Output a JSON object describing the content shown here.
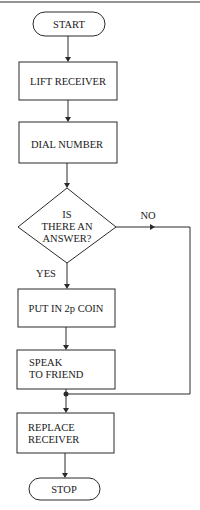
{
  "diagram": {
    "type": "flowchart",
    "nodes": [
      {
        "id": "start",
        "shape": "terminator",
        "lines": [
          "START"
        ]
      },
      {
        "id": "lift",
        "shape": "process",
        "lines": [
          "LIFT RECEIVER"
        ]
      },
      {
        "id": "dial",
        "shape": "process",
        "lines": [
          "DIAL NUMBER"
        ]
      },
      {
        "id": "answer",
        "shape": "decision",
        "lines": [
          "IS",
          "THERE AN",
          "ANSWER?"
        ]
      },
      {
        "id": "coin",
        "shape": "process",
        "lines": [
          "PUT IN 2p COIN"
        ]
      },
      {
        "id": "speak",
        "shape": "process",
        "lines": [
          "SPEAK",
          "TO FRIEND"
        ]
      },
      {
        "id": "replace",
        "shape": "process",
        "lines": [
          "REPLACE",
          "RECEIVER"
        ]
      },
      {
        "id": "stop",
        "shape": "terminator",
        "lines": [
          "STOP"
        ]
      }
    ],
    "edges": [
      {
        "from": "start",
        "to": "lift",
        "label": ""
      },
      {
        "from": "lift",
        "to": "dial",
        "label": ""
      },
      {
        "from": "dial",
        "to": "answer",
        "label": ""
      },
      {
        "from": "answer",
        "to": "coin",
        "label": "YES"
      },
      {
        "from": "answer",
        "to": "replace",
        "label": "NO"
      },
      {
        "from": "coin",
        "to": "speak",
        "label": ""
      },
      {
        "from": "speak",
        "to": "replace",
        "label": ""
      },
      {
        "from": "replace",
        "to": "stop",
        "label": ""
      }
    ],
    "colors": {
      "line": "#2a2a2a",
      "background": "#ffffff"
    }
  }
}
